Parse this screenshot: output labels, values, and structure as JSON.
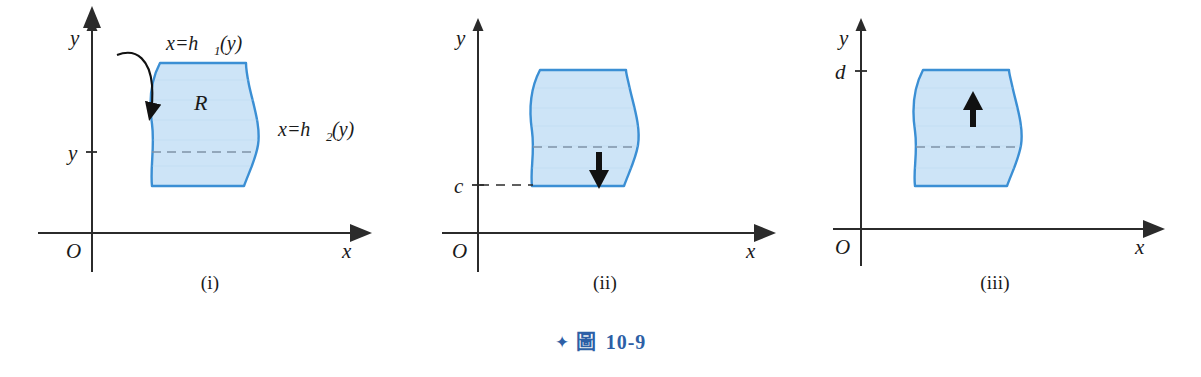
{
  "figure": {
    "caption_star": "✦",
    "caption_label": "圖",
    "caption_number": "10-9"
  },
  "colors": {
    "region_fill": "#cde4f7",
    "region_stroke": "#3b8fd4",
    "axis": "#2b2b2b",
    "caption_blue": "#2d5fa6",
    "dash": "#7f93a8",
    "arrow_black": "#111111"
  },
  "panels": [
    {
      "id": "i",
      "caption": "(i)",
      "axis": {
        "y_label": "y",
        "x_label": "x",
        "origin_label": "O"
      },
      "tick_labels": [
        {
          "name": "y-tick",
          "text": "y"
        }
      ],
      "annotations": [
        {
          "name": "upper-boundary-label",
          "text": "x=h₁(y)"
        },
        {
          "name": "lower-boundary-label",
          "text": "x=h₂(y)"
        },
        {
          "name": "region-label",
          "text": "R"
        }
      ],
      "has_curved_pointer": true,
      "has_dashed_slice": true,
      "direction_arrow": "none"
    },
    {
      "id": "ii",
      "caption": "(ii)",
      "axis": {
        "y_label": "y",
        "x_label": "x",
        "origin_label": "O"
      },
      "tick_labels": [
        {
          "name": "c-tick",
          "text": "c"
        }
      ],
      "annotations": [],
      "has_curved_pointer": false,
      "has_dashed_slice": true,
      "direction_arrow": "down"
    },
    {
      "id": "iii",
      "caption": "(iii)",
      "axis": {
        "y_label": "y",
        "x_label": "x",
        "origin_label": "O"
      },
      "tick_labels": [
        {
          "name": "d-tick",
          "text": "d"
        }
      ],
      "annotations": [],
      "has_curved_pointer": false,
      "has_dashed_slice": true,
      "direction_arrow": "up"
    }
  ]
}
